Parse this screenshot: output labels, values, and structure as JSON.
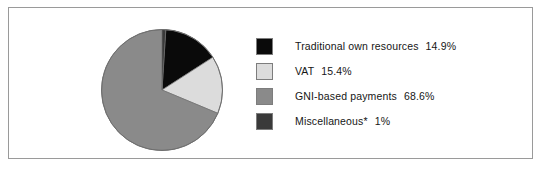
{
  "figure": {
    "background_color": "#ffffff",
    "frame_color": "#9a9a9a"
  },
  "chart_data": {
    "type": "pie",
    "title": "",
    "subtitle": "",
    "xlabel": "",
    "ylabel": "",
    "grid": false,
    "legend_position": "right",
    "start_angle_deg": 0,
    "direction": "clockwise",
    "categories": [
      "Traditional own resources",
      "VAT",
      "GNI-based payments",
      "Miscellaneous*"
    ],
    "values": [
      14.9,
      15.4,
      68.6,
      1
    ],
    "value_labels": [
      "14.9%",
      "15.4%",
      "68.6%",
      "1%"
    ],
    "colors": [
      "#0a0a0a",
      "#dcdcdc",
      "#8a8a8a",
      "#3a3a3a"
    ],
    "slices": [
      {
        "label": "Traditional own resources",
        "value": 14.9,
        "value_label": "14.9%",
        "color": "#0a0a0a",
        "start_deg": 3.6,
        "end_deg": 57.24
      },
      {
        "label": "VAT",
        "value": 15.4,
        "value_label": "15.4%",
        "color": "#dcdcdc",
        "start_deg": 57.24,
        "end_deg": 112.68
      },
      {
        "label": "GNI-based payments",
        "value": 68.6,
        "value_label": "68.6%",
        "color": "#8a8a8a",
        "start_deg": 112.68,
        "end_deg": 359.64
      },
      {
        "label": "Miscellaneous*",
        "value": 1,
        "value_label": "1%",
        "color": "#3a3a3a",
        "start_deg": 0,
        "end_deg": 3.6
      }
    ]
  },
  "legend": {
    "items": [
      {
        "label": "Traditional own resources",
        "value": "14.9%",
        "color": "#0a0a0a",
        "swatch_name": "legend-swatch-traditional-own-resources"
      },
      {
        "label": "VAT",
        "value": "15.4%",
        "color": "#dcdcdc",
        "swatch_name": "legend-swatch-vat"
      },
      {
        "label": "GNI-based payments",
        "value": "68.6%",
        "color": "#8a8a8a",
        "swatch_name": "legend-swatch-gni-based-payments"
      },
      {
        "label": "Miscellaneous*",
        "value": "1%",
        "color": "#3a3a3a",
        "swatch_name": "legend-swatch-miscellaneous"
      }
    ]
  }
}
